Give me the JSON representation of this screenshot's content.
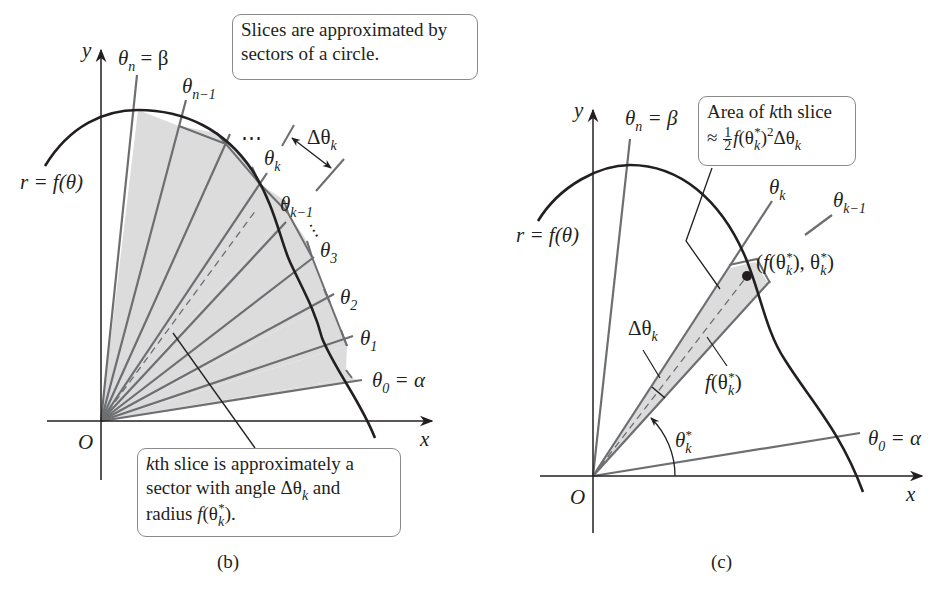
{
  "figure": {
    "panel_b": {
      "caption": "(b)",
      "axis_labels": {
        "x": "x",
        "y": "y",
        "origin": "O"
      },
      "curve_label": "r = f(θ)",
      "ray_labels": {
        "theta_n": {
          "sym": "θ",
          "sub": "n",
          "rest": " = β"
        },
        "theta_n_minus_1": {
          "sym": "θ",
          "sub": "n−1"
        },
        "theta_k": {
          "sym": "θ",
          "sub": "k"
        },
        "theta_k_minus_1": {
          "sym": "θ",
          "sub": "k−1"
        },
        "theta_3": {
          "sym": "θ",
          "sub": "3"
        },
        "theta_2": {
          "sym": "θ",
          "sub": "2"
        },
        "theta_1": {
          "sym": "θ",
          "sub": "1"
        },
        "theta_0": {
          "sym": "θ",
          "sub": "0",
          "rest": " = α"
        }
      },
      "delta_label": {
        "sym": "Δθ",
        "sub": "k"
      },
      "ellipsis": "⋯",
      "callout_top": {
        "line1": "Slices are approximated by",
        "line2": "sectors of a circle."
      },
      "callout_bottom": {
        "line1_italic": "k",
        "line1_rest": "th slice is approximately a",
        "line2_pre": "sector with angle ",
        "line2_sym": "Δθ",
        "line2_sub": "k",
        "line2_post": " and",
        "line3_pre": "radius ",
        "line3_f": "f",
        "line3_open": "(θ",
        "line3_sub": "k",
        "line3_sup": "*",
        "line3_close": ")."
      }
    },
    "panel_c": {
      "caption": "(c)",
      "axis_labels": {
        "x": "x",
        "y": "y",
        "origin": "O"
      },
      "curve_label": "r = f(θ)",
      "ray_labels": {
        "theta_n": {
          "sym": "θ",
          "sub": "n",
          "rest": " = β"
        },
        "theta_k": {
          "sym": "θ",
          "sub": "k"
        },
        "theta_k_minus_1": {
          "sym": "θ",
          "sub": "k−1"
        },
        "theta_0": {
          "sym": "θ",
          "sub": "0",
          "rest": " = α"
        }
      },
      "point_label": {
        "open": "(",
        "f": "f",
        "p1": "(θ",
        "sub1": "k",
        "sup1": "*",
        "p2": "), θ",
        "sub2": "k",
        "sup2": "*",
        "close": ")"
      },
      "delta_label": {
        "sym": "Δθ",
        "sub": "k"
      },
      "radius_label": {
        "f": "f",
        "open": "(θ",
        "sub": "k",
        "sup": "*",
        "close": ")"
      },
      "angle_label": {
        "sym": "θ",
        "sub": "k",
        "sup": "*"
      },
      "callout": {
        "line1_pre": "Area of ",
        "line1_italic": "k",
        "line1_post": "th slice",
        "line2_approx": "≈ ",
        "line2_num": "1",
        "line2_den": "2",
        "line2_f": "f",
        "line2_open": "(θ",
        "line2_sub": "k",
        "line2_sup": "*",
        "line2_close": ")",
        "line2_pow": "2",
        "line2_delta": "Δθ",
        "line2_delta_sub": "k"
      }
    },
    "colors": {
      "ink": "#231f20",
      "ray": "#6d6e71",
      "fill": "#dcdcdc",
      "box_border": "#8a8a8a"
    }
  }
}
